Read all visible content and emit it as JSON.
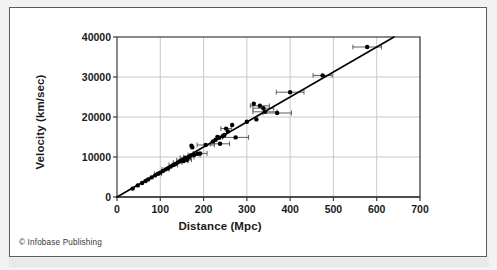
{
  "figure": {
    "copyright": "© Infobase Publishing",
    "background_color": "#ffffff",
    "outer_background_color": "#f2f2f2",
    "border_color": "#5a5a5a"
  },
  "chart_data": {
    "type": "scatter",
    "title": "",
    "subtitle": "",
    "xlabel": "Distance (Mpc)",
    "ylabel": "Velocity (km/sec)",
    "xlim": [
      0,
      700
    ],
    "ylim": [
      0,
      40000
    ],
    "xticks": [
      0,
      100,
      200,
      300,
      400,
      500,
      600,
      700
    ],
    "xtick_labels": [
      "0",
      "100",
      "200",
      "300",
      "400",
      "500",
      "600",
      "700"
    ],
    "yticks": [
      0,
      10000,
      20000,
      30000,
      40000
    ],
    "ytick_labels": [
      "0",
      "10000",
      "20000",
      "30000",
      "40000"
    ],
    "grid": true,
    "grid_color": "#c8c8c8",
    "legend": null,
    "legend_position": "none",
    "marker_color": "#000000",
    "marker_size": 3.0,
    "errorbar_color": "#4d4d4d",
    "annotations": [],
    "series": [
      {
        "name": "Fit line (Hubble law)",
        "type": "line",
        "color": "#000000",
        "line_width": 1.6,
        "x": [
          0,
          640
        ],
        "y": [
          0,
          40000
        ],
        "slope_km_s_per_Mpc": 62.5
      },
      {
        "name": "Galaxies",
        "type": "scatter",
        "color": "#000000",
        "points": [
          {
            "x": 36,
            "y": 2100,
            "xerr": 0
          },
          {
            "x": 48,
            "y": 2900,
            "xerr": 0
          },
          {
            "x": 58,
            "y": 3500,
            "xerr": 0
          },
          {
            "x": 66,
            "y": 4000,
            "xerr": 0
          },
          {
            "x": 72,
            "y": 4400,
            "xerr": 0
          },
          {
            "x": 80,
            "y": 4900,
            "xerr": 0
          },
          {
            "x": 88,
            "y": 5400,
            "xerr": 0
          },
          {
            "x": 95,
            "y": 5800,
            "xerr": 8
          },
          {
            "x": 100,
            "y": 6100,
            "xerr": 0
          },
          {
            "x": 106,
            "y": 6500,
            "xerr": 0
          },
          {
            "x": 112,
            "y": 6900,
            "xerr": 8
          },
          {
            "x": 118,
            "y": 7200,
            "xerr": 0
          },
          {
            "x": 124,
            "y": 7600,
            "xerr": 0
          },
          {
            "x": 130,
            "y": 8000,
            "xerr": 10
          },
          {
            "x": 134,
            "y": 8200,
            "xerr": 0
          },
          {
            "x": 140,
            "y": 8600,
            "xerr": 10
          },
          {
            "x": 145,
            "y": 8900,
            "xerr": 0
          },
          {
            "x": 150,
            "y": 9200,
            "xerr": 12
          },
          {
            "x": 154,
            "y": 9000,
            "xerr": 10
          },
          {
            "x": 158,
            "y": 9800,
            "xerr": 12
          },
          {
            "x": 162,
            "y": 9300,
            "xerr": 10
          },
          {
            "x": 166,
            "y": 10000,
            "xerr": 12
          },
          {
            "x": 170,
            "y": 10400,
            "xerr": 0
          },
          {
            "x": 172,
            "y": 12800,
            "xerr": 0
          },
          {
            "x": 174,
            "y": 12400,
            "xerr": 0
          },
          {
            "x": 178,
            "y": 10500,
            "xerr": 14
          },
          {
            "x": 186,
            "y": 10800,
            "xerr": 0
          },
          {
            "x": 192,
            "y": 10900,
            "xerr": 16
          },
          {
            "x": 205,
            "y": 13000,
            "xerr": 20
          },
          {
            "x": 222,
            "y": 13900,
            "xerr": 0
          },
          {
            "x": 228,
            "y": 14300,
            "xerr": 0
          },
          {
            "x": 232,
            "y": 15000,
            "xerr": 0
          },
          {
            "x": 236,
            "y": 14800,
            "xerr": 0
          },
          {
            "x": 238,
            "y": 13300,
            "xerr": 22
          },
          {
            "x": 244,
            "y": 15200,
            "xerr": 0
          },
          {
            "x": 248,
            "y": 15500,
            "xerr": 0
          },
          {
            "x": 252,
            "y": 17100,
            "xerr": 12
          },
          {
            "x": 256,
            "y": 16400,
            "xerr": 0
          },
          {
            "x": 266,
            "y": 18000,
            "xerr": 0
          },
          {
            "x": 274,
            "y": 14900,
            "xerr": 30
          },
          {
            "x": 300,
            "y": 18800,
            "xerr": 0
          },
          {
            "x": 316,
            "y": 23300,
            "xerr": 0
          },
          {
            "x": 322,
            "y": 19400,
            "xerr": 0
          },
          {
            "x": 330,
            "y": 22800,
            "xerr": 22
          },
          {
            "x": 338,
            "y": 22200,
            "xerr": 24
          },
          {
            "x": 342,
            "y": 21300,
            "xerr": 28
          },
          {
            "x": 370,
            "y": 21000,
            "xerr": 33
          },
          {
            "x": 400,
            "y": 26200,
            "xerr": 32
          },
          {
            "x": 475,
            "y": 30400,
            "xerr": 22
          },
          {
            "x": 578,
            "y": 37500,
            "xerr": 33
          }
        ]
      }
    ]
  }
}
